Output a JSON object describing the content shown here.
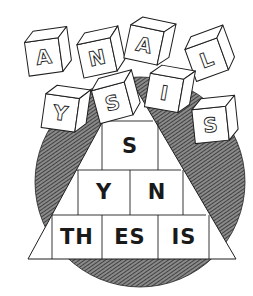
{
  "illustration": {
    "subject": "analysis-synthesis",
    "colors": {
      "ink": "#1f1f1f",
      "paper": "#ffffff",
      "hatch": "#5a5a5a"
    },
    "circle": {
      "cx": 140,
      "cy": 182,
      "r": 105
    },
    "pyramid": {
      "apex": [
        128,
        75
      ],
      "base_left": [
        28,
        259
      ],
      "base_right": [
        236,
        259
      ],
      "rows": [
        {
          "cells": [
            {
              "text": "S"
            }
          ]
        },
        {
          "cells": [
            {
              "text": ""
            },
            {
              "text": "Y"
            },
            {
              "text": "N"
            },
            {
              "text": ""
            }
          ]
        },
        {
          "cells": [
            {
              "text": ""
            },
            {
              "text": "TH"
            },
            {
              "text": "ES"
            },
            {
              "text": "IS"
            },
            {
              "text": ""
            }
          ]
        }
      ]
    },
    "cubes": [
      {
        "letter": "A",
        "x": 43,
        "y": 52,
        "rot": -8
      },
      {
        "letter": "N",
        "x": 96,
        "y": 53,
        "rot": -12
      },
      {
        "letter": "A",
        "x": 145,
        "y": 40,
        "rot": 12
      },
      {
        "letter": "L",
        "x": 205,
        "y": 55,
        "rot": -20
      },
      {
        "letter": "Y",
        "x": 61,
        "y": 108,
        "rot": 8
      },
      {
        "letter": "S",
        "x": 111,
        "y": 98,
        "rot": -15
      },
      {
        "letter": "I",
        "x": 165,
        "y": 88,
        "rot": 10
      },
      {
        "letter": "S",
        "x": 210,
        "y": 120,
        "rot": -6
      }
    ]
  }
}
